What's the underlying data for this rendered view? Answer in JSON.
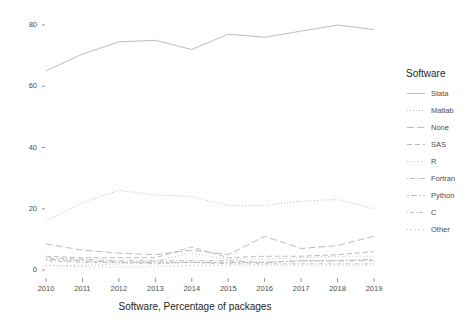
{
  "chart_data": {
    "type": "line",
    "title": "",
    "subtitle": "",
    "xlabel": "Software, Percentage of packages",
    "ylabel": "",
    "x": [
      2010,
      2011,
      2012,
      2013,
      2014,
      2015,
      2016,
      2017,
      2018,
      2019
    ],
    "categories": [
      "2010",
      "2011",
      "2012",
      "2013",
      "2014",
      "2015",
      "2016",
      "2017",
      "2018",
      "2019"
    ],
    "xlim": [
      2010,
      2019
    ],
    "ylim": [
      0,
      84
    ],
    "y_ticks": [
      0,
      20,
      40,
      60,
      80
    ],
    "y_tick_labels": [
      "0",
      "20",
      "40",
      "60",
      "80"
    ],
    "x_ticks": [
      2010,
      2011,
      2012,
      2013,
      2014,
      2015,
      2016,
      2017,
      2018,
      2019
    ],
    "x_tick_labels": [
      "2010",
      "2011",
      "2012",
      "2013",
      "2014",
      "2015",
      "2016",
      "2017",
      "2018",
      "2019"
    ],
    "grid": false,
    "legend_position": "right",
    "legend_title": "Software",
    "line_color": "#bdbdbd",
    "series": [
      {
        "name": "Stata",
        "dash": "solid",
        "dasharray": "",
        "values": [
          65.0,
          70.5,
          74.5,
          75.0,
          72.0,
          77.0,
          76.0,
          78.0,
          80.0,
          78.5
        ]
      },
      {
        "name": "Matlab",
        "dash": "dotted",
        "dasharray": "1,2",
        "values": [
          16.0,
          22.0,
          26.0,
          24.5,
          24.0,
          21.0,
          21.0,
          22.5,
          23.0,
          20.0
        ]
      },
      {
        "name": "None",
        "dash": "longdash",
        "dasharray": "7,3",
        "values": [
          8.5,
          6.5,
          5.5,
          5.0,
          6.5,
          5.0,
          11.0,
          7.0,
          8.0,
          11.0
        ]
      },
      {
        "name": "SAS",
        "dash": "dashed",
        "dasharray": "5,3",
        "values": [
          4.5,
          4.0,
          4.0,
          4.0,
          7.5,
          4.0,
          4.5,
          4.5,
          5.0,
          6.0
        ]
      },
      {
        "name": "R",
        "dash": "dotted-fine",
        "dasharray": "1,2.5",
        "values": [
          1.5,
          1.5,
          2.0,
          3.0,
          5.5,
          3.5,
          3.5,
          4.0,
          4.5,
          4.5
        ]
      },
      {
        "name": "Fortran",
        "dash": "dotdash",
        "dasharray": "1,2,5,2",
        "values": [
          4.0,
          3.5,
          3.0,
          3.0,
          3.0,
          3.0,
          2.5,
          3.0,
          3.0,
          3.0
        ]
      },
      {
        "name": "Python",
        "dash": "twodash",
        "dasharray": "2,2,6,2",
        "values": [
          3.5,
          3.0,
          2.5,
          2.5,
          2.5,
          2.5,
          2.5,
          3.0,
          3.0,
          3.5
        ]
      },
      {
        "name": "C",
        "dash": "dotdash-long",
        "dasharray": "1,2,4,2",
        "values": [
          3.0,
          2.5,
          2.5,
          2.0,
          2.5,
          2.0,
          2.0,
          2.0,
          2.0,
          2.0
        ]
      },
      {
        "name": "Other",
        "dash": "dotted-sparse",
        "dasharray": "1,3",
        "values": [
          1.5,
          1.0,
          1.0,
          1.0,
          1.5,
          1.5,
          1.5,
          1.5,
          1.5,
          1.5
        ]
      }
    ]
  },
  "legend": {
    "title": "Software",
    "items": [
      {
        "label": "Stata"
      },
      {
        "label": "Matlab"
      },
      {
        "label": "None"
      },
      {
        "label": "SAS"
      },
      {
        "label": "R"
      },
      {
        "label": "Fortran"
      },
      {
        "label": "Python"
      },
      {
        "label": "C"
      },
      {
        "label": "Other"
      }
    ]
  },
  "axes": {
    "x_title": "Software, Percentage of packages"
  }
}
